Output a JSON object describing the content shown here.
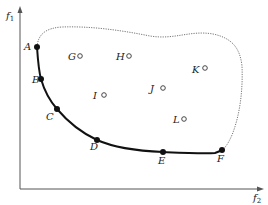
{
  "axes": {
    "y_label": "f",
    "y_label_sub": "1",
    "x_label": "f",
    "x_label_sub": "2"
  },
  "pareto_points": [
    {
      "label": "A",
      "x": 37,
      "y": 47,
      "lx": 24,
      "ly": 50
    },
    {
      "label": "B",
      "x": 41,
      "y": 79,
      "lx": 32,
      "ly": 83
    },
    {
      "label": "C",
      "x": 57,
      "y": 109,
      "lx": 46,
      "ly": 120
    },
    {
      "label": "D",
      "x": 97,
      "y": 140,
      "lx": 90,
      "ly": 150
    },
    {
      "label": "E",
      "x": 163,
      "y": 152,
      "lx": 158,
      "ly": 164
    },
    {
      "label": "F",
      "x": 222,
      "y": 150,
      "lx": 217,
      "ly": 162
    }
  ],
  "interior_points": [
    {
      "label": "G",
      "x": 80,
      "y": 56,
      "lx": 68,
      "ly": 60
    },
    {
      "label": "H",
      "x": 129,
      "y": 56,
      "lx": 116,
      "ly": 60
    },
    {
      "label": "I",
      "x": 104,
      "y": 95,
      "lx": 93,
      "ly": 99
    },
    {
      "label": "J",
      "x": 163,
      "y": 88,
      "lx": 150,
      "ly": 92
    },
    {
      "label": "K",
      "x": 205,
      "y": 68,
      "lx": 192,
      "ly": 73
    },
    {
      "label": "L",
      "x": 184,
      "y": 119,
      "lx": 173,
      "ly": 123
    }
  ],
  "colors": {
    "axis": "#555555",
    "front": "#111111",
    "boundary": "#666666",
    "point": "#111111"
  }
}
